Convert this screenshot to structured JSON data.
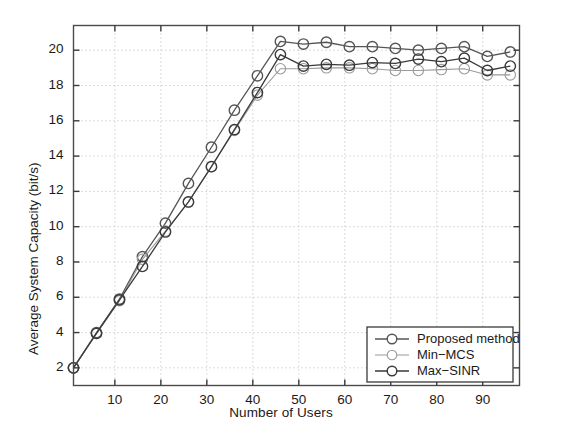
{
  "chart_data": {
    "type": "line",
    "title": "",
    "xlabel": "Number of Users",
    "ylabel": "Average System Capacity (bit/s)",
    "xlim": [
      1,
      98
    ],
    "ylim": [
      1.0,
      21.4
    ],
    "xticks": [
      10,
      20,
      30,
      40,
      50,
      60,
      70,
      80,
      90
    ],
    "yticks": [
      2,
      4,
      6,
      8,
      10,
      12,
      14,
      16,
      18,
      20
    ],
    "grid": true,
    "grid_style": "dotted",
    "legend_position": "lower right",
    "x": [
      1,
      6,
      11,
      16,
      21,
      26,
      31,
      36,
      41,
      46,
      51,
      56,
      61,
      66,
      71,
      76,
      81,
      86,
      91,
      96
    ],
    "series": [
      {
        "name": "Proposed method",
        "color": "#555555",
        "marker": "o",
        "values": [
          2.0,
          4.0,
          5.9,
          8.3,
          10.2,
          12.45,
          14.5,
          16.6,
          18.55,
          20.5,
          20.35,
          20.45,
          20.2,
          20.2,
          20.1,
          20.0,
          20.1,
          20.2,
          19.65,
          19.9
        ]
      },
      {
        "name": "Min-MCS",
        "color": "#9a9a9a",
        "marker": "o",
        "values": [
          2.0,
          3.95,
          5.8,
          8.15,
          9.75,
          11.4,
          13.4,
          15.45,
          17.45,
          18.95,
          18.95,
          19.0,
          19.0,
          18.95,
          18.85,
          18.85,
          18.9,
          18.95,
          18.6,
          18.6
        ]
      },
      {
        "name": "Max-SINR",
        "color": "#3a3a3a",
        "marker": "o",
        "values": [
          2.0,
          3.95,
          5.85,
          7.75,
          9.7,
          11.4,
          13.4,
          15.5,
          17.6,
          19.75,
          19.1,
          19.2,
          19.15,
          19.3,
          19.25,
          19.5,
          19.35,
          19.55,
          18.85,
          19.1
        ]
      }
    ]
  },
  "legend": {
    "items": [
      {
        "label": "Proposed method"
      },
      {
        "label": "Min−MCS"
      },
      {
        "label": "Max−SINR"
      }
    ]
  },
  "ytick_labels": [
    "20",
    "18",
    "16",
    "14",
    "12",
    "10",
    "8",
    "6",
    "4",
    "2"
  ],
  "xtick_labels": [
    "10",
    "20",
    "30",
    "40",
    "50",
    "60",
    "70",
    "80",
    "90"
  ]
}
